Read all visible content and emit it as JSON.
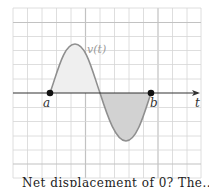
{
  "figure": {
    "curve_label": "v(t)",
    "axis_label": "t",
    "point_a_label": "a",
    "point_b_label": "b",
    "caption_fragment": "Net displacement of 0? The..."
  },
  "colors": {
    "grid": "#d4d4d4",
    "grid_major": "#c4c4c4",
    "curve": "#8f8f8f",
    "fill_positive": "#efefef",
    "fill_negative": "#cfcfcf",
    "axis": "#333333",
    "point": "#111111"
  }
}
